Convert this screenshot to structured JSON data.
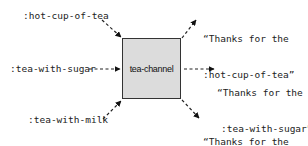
{
  "channel": {
    "label": "tea-channel"
  },
  "inputs": [
    {
      "label": ":hot-cup-of-tea"
    },
    {
      "label": ":tea-with-sugar"
    },
    {
      "label": ":tea-with-milk"
    }
  ],
  "outputs": [
    {
      "line1": "“Thanks for the",
      "line2": ":hot-cup-of-tea”"
    },
    {
      "line1": "“Thanks for the",
      "line2": ":tea-with-sugar”"
    },
    {
      "line1": "“Thanks for the",
      "line2": ":tea-with-milk”"
    }
  ]
}
